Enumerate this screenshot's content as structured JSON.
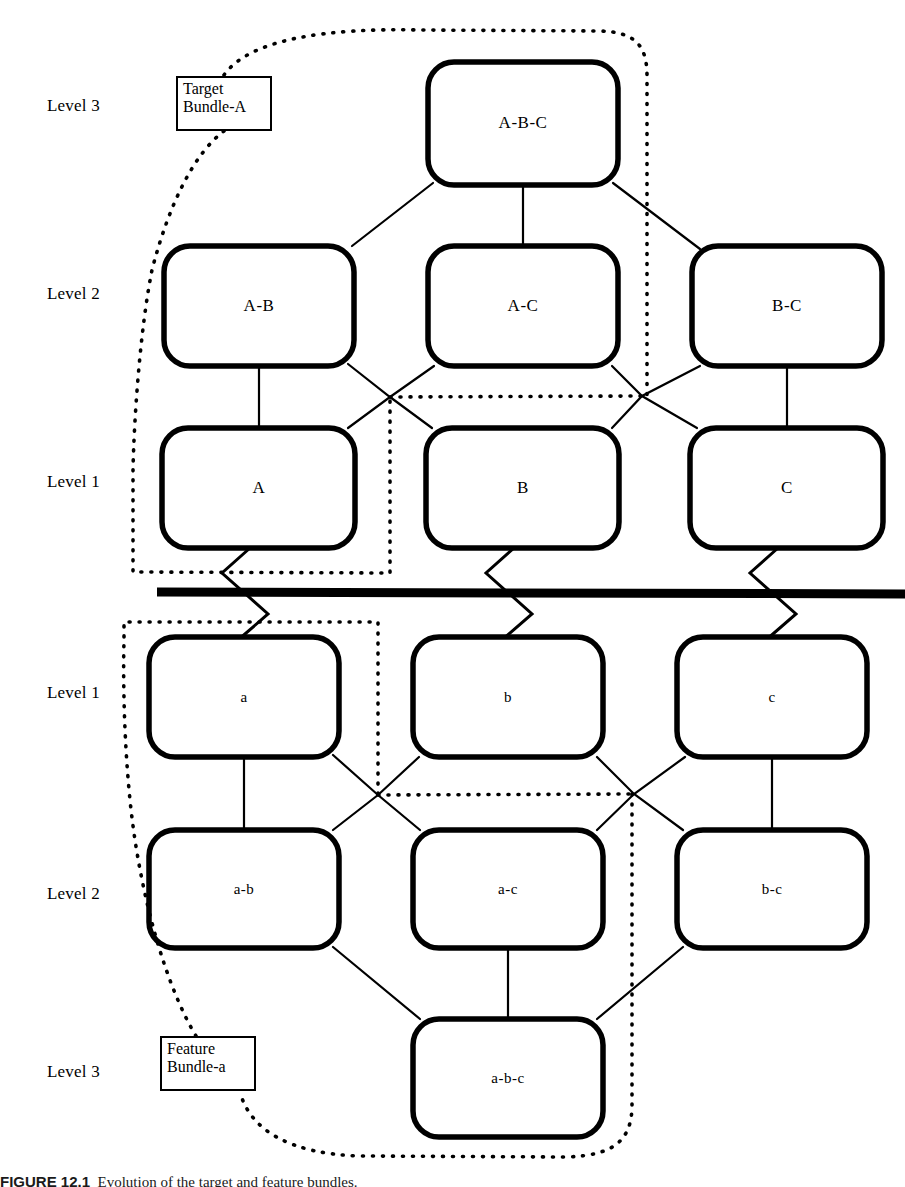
{
  "figure": {
    "caption_label": "FIGURE 12.1",
    "caption_body": "Evolution of the target and feature bundles."
  },
  "upper_section": {
    "name": "Target Bundle-A lattice",
    "callout": {
      "line1": "Target",
      "line2": "Bundle-A"
    },
    "level_labels": [
      {
        "text": "Level 3",
        "y": 96
      },
      {
        "text": "Level 2",
        "y": 284
      },
      {
        "text": "Level 1",
        "y": 472
      }
    ],
    "nodes": [
      {
        "id": "ABC",
        "label": "A-B-C",
        "x": 523,
        "y": 123,
        "w": 190,
        "h": 123,
        "level": 3
      },
      {
        "id": "AB",
        "label": "A-B",
        "x": 259,
        "y": 306,
        "w": 190,
        "h": 120,
        "level": 2
      },
      {
        "id": "AC",
        "label": "A-C",
        "x": 523,
        "y": 306,
        "w": 190,
        "h": 120,
        "level": 2
      },
      {
        "id": "BC",
        "label": "B-C",
        "x": 787,
        "y": 306,
        "w": 190,
        "h": 120,
        "level": 2
      },
      {
        "id": "A",
        "label": "A",
        "x": 259,
        "y": 488,
        "w": 193,
        "h": 120,
        "level": 1
      },
      {
        "id": "B",
        "label": "B",
        "x": 523,
        "y": 488,
        "w": 193,
        "h": 120,
        "level": 1
      },
      {
        "id": "C",
        "label": "C",
        "x": 787,
        "y": 488,
        "w": 193,
        "h": 120,
        "level": 1
      }
    ]
  },
  "lower_section": {
    "name": "Feature Bundle-a lattice",
    "callout": {
      "line1": "Feature",
      "line2": "Bundle-a"
    },
    "level_labels": [
      {
        "text": "Level 1",
        "y": 683
      },
      {
        "text": "Level 2",
        "y": 884
      },
      {
        "text": "Level 3",
        "y": 1062
      }
    ],
    "nodes": [
      {
        "id": "a",
        "label": "a",
        "x": 244,
        "y": 697,
        "w": 190,
        "h": 120,
        "level": 1
      },
      {
        "id": "b",
        "label": "b",
        "x": 508,
        "y": 697,
        "w": 190,
        "h": 120,
        "level": 1
      },
      {
        "id": "c",
        "label": "c",
        "x": 772,
        "y": 697,
        "w": 190,
        "h": 120,
        "level": 1
      },
      {
        "id": "ab",
        "label": "a-b",
        "x": 244,
        "y": 889,
        "w": 190,
        "h": 118,
        "level": 2
      },
      {
        "id": "ac",
        "label": "a-c",
        "x": 508,
        "y": 889,
        "w": 190,
        "h": 118,
        "level": 2
      },
      {
        "id": "bc",
        "label": "b-c",
        "x": 772,
        "y": 889,
        "w": 190,
        "h": 118,
        "level": 2
      },
      {
        "id": "abc",
        "label": "a-b-c",
        "x": 508,
        "y": 1078,
        "w": 190,
        "h": 118,
        "level": 3
      }
    ]
  },
  "divider": {
    "name": "section-divider",
    "y": 592
  },
  "colors": {
    "ink": "#000000",
    "paper": "#ffffff"
  }
}
